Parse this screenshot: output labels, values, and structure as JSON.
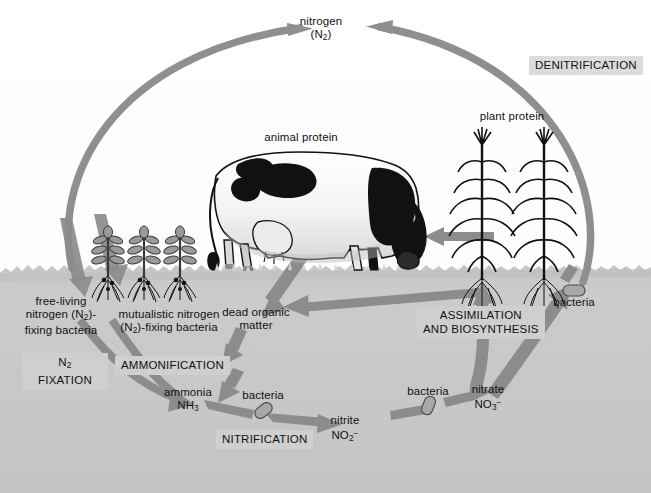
{
  "figure": {
    "type": "diagram"
  },
  "colors": {
    "arrow": "#8c8c8c",
    "arc": "#8f8f8f",
    "soil": "#c9c9c9",
    "soil_dark": "#bdbdbd",
    "sky": "#ffffff",
    "label_box": "#dcdcdc",
    "text": "#111111",
    "bacteria_fill": "#a8a8a8"
  },
  "labels": {
    "nitrogen": {
      "line1": "nitrogen",
      "line2_pre": "(N",
      "line2_sub": "2",
      "line2_post": ")"
    },
    "denitrification": "DENITRIFICATION",
    "animal_protein": "animal protein",
    "plant_protein": "plant protein",
    "free_living": {
      "line1": "free-living",
      "line2_pre": "nitrogen (N",
      "line2_sub": "2",
      "line2_post": ")-",
      "line3": "fixing bacteria"
    },
    "mutualistic": {
      "line1": "mutualistic nitrogen",
      "line2_pre": "(N",
      "line2_sub": "2",
      "line2_post": ")-fixing bacteria"
    },
    "n2_fixation": {
      "line1_pre": "N",
      "line1_sub": "2",
      "line2": "FIXATION"
    },
    "ammonification": "AMMONIFICATION",
    "dead_organic_matter": {
      "line1": "dead organic",
      "line2": "matter"
    },
    "assimilation": {
      "line1": "ASSIMILATION",
      "line2": "AND BIOSYNTHESIS"
    },
    "ammonia": {
      "line1": "ammonia",
      "line2_pre": "NH",
      "line2_sub": "3"
    },
    "nitrification": "NITRIFICATION",
    "nitrite": {
      "line1": "nitrite",
      "line2_pre": "NO",
      "line2_sub": "2",
      "line2_sup": "−"
    },
    "nitrate": {
      "line1": "nitrate",
      "line2_pre": "NO",
      "line2_sub": "3",
      "line2_sup": "−"
    },
    "bacteria_nitrification_1": "bacteria",
    "bacteria_nitrification_2": "bacteria",
    "bacteria_denitrifying": "bacteria"
  },
  "diagram_nodes": [
    "nitrogen (N2)",
    "animal protein",
    "plant protein",
    "free-living nitrogen (N2)-fixing bacteria",
    "mutualistic nitrogen (N2)-fixing bacteria",
    "dead organic matter",
    "ammonia NH3",
    "nitrite NO2-",
    "nitrate NO3-",
    "bacteria"
  ],
  "diagram_processes": [
    "N2 FIXATION",
    "AMMONIFICATION",
    "NITRIFICATION",
    "ASSIMILATION AND BIOSYNTHESIS",
    "DENITRIFICATION"
  ]
}
